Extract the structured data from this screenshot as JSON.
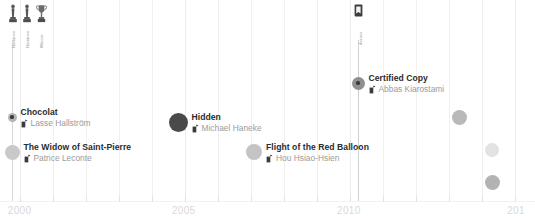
{
  "chart_data": {
    "type": "scatter",
    "title": "",
    "xlabel": "",
    "ylabel": "",
    "xlim": [
      1999.4,
      2015.6
    ],
    "grid": true,
    "legend": false,
    "axis": {
      "tick_years": [
        2000,
        2001,
        2002,
        2003,
        2004,
        2005,
        2006,
        2007,
        2008,
        2009,
        2010,
        2011,
        2012,
        2013,
        2014,
        2015
      ],
      "labeled_ticks": [
        {
          "label": "2000",
          "year": 2000,
          "clipped": true
        },
        {
          "label": "2005",
          "year": 2005,
          "clipped": false
        },
        {
          "label": "2010",
          "year": 2010,
          "clipped": false
        },
        {
          "label": "201",
          "year": 2015,
          "clipped": true
        }
      ]
    },
    "points": [
      {
        "title": "Chocolat",
        "director": "Lasse Hallström",
        "year": 2000,
        "x": 12,
        "y": 117,
        "dot_size": 9,
        "dot_color": "#b4b4b4",
        "has_core": true,
        "label_side": "right"
      },
      {
        "title": "The Widow of Saint-Pierre",
        "director": "Patrice Leconte",
        "year": 2000,
        "x": 12,
        "y": 152,
        "dot_size": 15,
        "dot_color": "#c9c9c9",
        "has_core": false,
        "label_side": "right"
      },
      {
        "title": "Hidden",
        "director": "Michael Haneke",
        "year": 2005,
        "x": 178,
        "y": 122,
        "dot_size": 19,
        "dot_color": "#4a4a4a",
        "has_core": false,
        "label_side": "right"
      },
      {
        "title": "Flight of the Red Balloon",
        "director": "Hou Hsiao-Hsien",
        "year": 2007,
        "x": 254,
        "y": 152,
        "dot_size": 16,
        "dot_color": "#c4c4c4",
        "has_core": false,
        "label_side": "right"
      },
      {
        "title": "Certified Copy",
        "director": "Abbas Kiarostami",
        "year": 2010,
        "x": 358,
        "y": 83,
        "dot_size": 13,
        "dot_color": "#8f8f8f",
        "has_core": true,
        "label_side": "right"
      },
      {
        "title": "Camille Claudel 1915",
        "director": "Bruno Dumont",
        "year": 2013,
        "x": 459,
        "y": 117,
        "dot_size": 15,
        "dot_color": "#b9b9b9",
        "has_core": false,
        "label_side": "left"
      },
      {
        "title": "Godzilla",
        "director": "Gareth Edwards",
        "year": 2014,
        "x": 492,
        "y": 150,
        "dot_size": 14,
        "dot_color": "#e3e3e3",
        "has_core": false,
        "label_side": "left"
      },
      {
        "title": "Clouds of Sils Maria",
        "director": "Olivier Assayas",
        "year": 2014,
        "x": 492,
        "y": 182,
        "dot_size": 15,
        "dot_color": "#b3b3b3",
        "has_core": false,
        "label_side": "left"
      }
    ],
    "annotations": [
      {
        "icon": "award-statuette-icon",
        "label": "Nominee",
        "x": 10,
        "y": 6
      },
      {
        "icon": "award-statuette-icon",
        "label": "Nominee",
        "x": 24,
        "y": 6
      },
      {
        "icon": "award-trophy-icon",
        "label": "Winner",
        "x": 38,
        "y": 6
      },
      {
        "icon": "film-award-icon",
        "label": "Across",
        "x": 354,
        "y": 6
      }
    ]
  },
  "annotation_labels": {
    "left_1": "Nominee",
    "left_2": "Nominee",
    "left_3": "Winner",
    "across": "Across"
  },
  "icons": {
    "statuette": "award-statuette-icon",
    "trophy": "award-trophy-icon",
    "film": "film-award-icon",
    "director": "award-badge-icon"
  }
}
